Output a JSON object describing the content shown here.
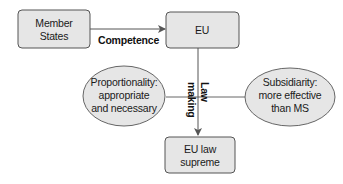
{
  "diagram": {
    "colors": {
      "box_fill": "#e6e6e6",
      "box_stroke": "#555555",
      "ellipse_fill": "#e6e6e6",
      "ellipse_stroke": "#666666",
      "line": "#555555",
      "text": "#1a1a1a"
    },
    "nodes": {
      "member_states": {
        "shape": "rounded-rectangle",
        "lines": [
          "Member",
          "States"
        ]
      },
      "eu": {
        "shape": "rounded-rectangle",
        "lines": [
          "EU"
        ]
      },
      "eu_law_supreme": {
        "shape": "rounded-rectangle",
        "lines": [
          "EU law",
          "supreme"
        ]
      },
      "proportionality": {
        "shape": "ellipse",
        "lines": [
          "Proportionality:",
          "appropriate",
          "and necessary"
        ]
      },
      "subsidiarity": {
        "shape": "ellipse",
        "lines": [
          "Subsidiarity:",
          "more effective",
          "than MS"
        ]
      }
    },
    "edges": {
      "competence": {
        "from": "Member States",
        "to": "EU",
        "label": "Competence",
        "arrow": true
      },
      "law_making": {
        "from": "EU",
        "to": "EU law supreme",
        "label_lines": [
          "Law",
          "making"
        ],
        "arrow": true
      },
      "constraints": {
        "from": "Proportionality",
        "to": "Subsidiarity",
        "arrow": false
      }
    }
  }
}
